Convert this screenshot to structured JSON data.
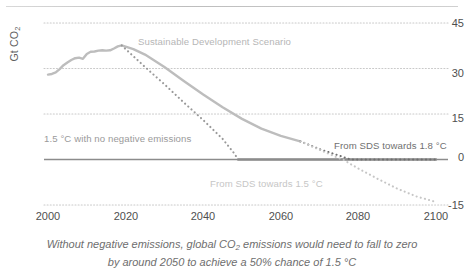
{
  "chart_data": {
    "type": "line",
    "title": "",
    "xlabel": "",
    "ylabel": "Gt CO2",
    "ylabel_display": "Gt CO",
    "ylabel_sub": "2",
    "xlim": [
      2000,
      2100
    ],
    "ylim": [
      -15,
      45
    ],
    "grid": true,
    "grid_style": "dotted-horizontal",
    "legend_position": "inline-annotations",
    "yticks": [
      45,
      30,
      15,
      0,
      -15
    ],
    "xticks": [
      2000,
      2020,
      2040,
      2060,
      2080,
      2100
    ],
    "series": [
      {
        "name": "Historical and Sustainable Development Scenario",
        "label": "Sustainable Development Scenario",
        "style": "solid",
        "color": "#bdbdbd",
        "points": [
          [
            2000,
            28.0
          ],
          [
            2001,
            28.2
          ],
          [
            2002,
            28.7
          ],
          [
            2003,
            29.8
          ],
          [
            2004,
            31.1
          ],
          [
            2005,
            32.0
          ],
          [
            2006,
            32.8
          ],
          [
            2007,
            33.4
          ],
          [
            2008,
            33.6
          ],
          [
            2009,
            33.2
          ],
          [
            2010,
            34.8
          ],
          [
            2011,
            35.5
          ],
          [
            2012,
            35.6
          ],
          [
            2013,
            35.9
          ],
          [
            2014,
            36.0
          ],
          [
            2015,
            35.9
          ],
          [
            2016,
            36.0
          ],
          [
            2017,
            36.6
          ],
          [
            2018,
            37.3
          ],
          [
            2019,
            37.6
          ],
          [
            2020,
            37.2
          ],
          [
            2022,
            36.4
          ],
          [
            2025,
            34.6
          ],
          [
            2030,
            30.5
          ],
          [
            2035,
            25.9
          ],
          [
            2040,
            21.4
          ],
          [
            2045,
            17.2
          ],
          [
            2050,
            13.4
          ],
          [
            2055,
            10.2
          ],
          [
            2060,
            7.8
          ],
          [
            2065,
            6.0
          ]
        ]
      },
      {
        "name": "1.5 C with no negative emissions",
        "label": "1.5 °C with  no negative emissions",
        "style": "dotted",
        "color": "#9a9a9a",
        "points": [
          [
            2019,
            37.6
          ],
          [
            2025,
            30.5
          ],
          [
            2030,
            24.8
          ],
          [
            2035,
            18.8
          ],
          [
            2040,
            13.0
          ],
          [
            2045,
            6.8
          ],
          [
            2048,
            2.0
          ],
          [
            2049,
            0.0
          ]
        ]
      },
      {
        "name": "Zero emissions floor after 2049",
        "label": "",
        "style": "solid",
        "color": "#8c8c8c",
        "points": [
          [
            2049,
            0.0
          ],
          [
            2100,
            0.0
          ]
        ]
      },
      {
        "name": "From SDS towards 1.8 C",
        "label": "From SDS towards 1.8 °C",
        "style": "dotted",
        "color": "#6f6f6f",
        "points": [
          [
            2065,
            6.0
          ],
          [
            2070,
            3.4
          ],
          [
            2075,
            1.3
          ],
          [
            2078,
            0.0
          ],
          [
            2080,
            0.0
          ],
          [
            2100,
            0.0
          ]
        ]
      },
      {
        "name": "From SDS towards 1.5 C",
        "label": "From SDS towards 1.5 °C",
        "style": "dotted",
        "color": "#c6c6c6",
        "points": [
          [
            2065,
            6.0
          ],
          [
            2070,
            3.2
          ],
          [
            2075,
            0.4
          ],
          [
            2076,
            0.0
          ],
          [
            2080,
            -3.0
          ],
          [
            2085,
            -6.4
          ],
          [
            2090,
            -9.6
          ],
          [
            2095,
            -12.2
          ],
          [
            2100,
            -14.0
          ]
        ]
      }
    ],
    "annotations": [
      {
        "text": "Sustainable Development Scenario",
        "x": 2037,
        "y": 39,
        "color": "#b6b6b6"
      },
      {
        "text": "1.5 °C with  no negative emissions",
        "x": 2005,
        "y": 6,
        "color": "#9a9a9a"
      },
      {
        "text": "From SDS towards 1.8 °C",
        "x": 2079,
        "y": 3,
        "color": "#6f6f6f"
      },
      {
        "text": "From SDS towards 1.5 °C",
        "x": 2048,
        "y": -8,
        "color": "#c6c6c6"
      }
    ],
    "caption_line1": "Without negative emissions, global CO2 emissions would need to fall to zero",
    "caption_line2": "by around 2050 to achieve a 50% chance of 1.5 °C"
  },
  "axis": {
    "y_title_main": "Gt CO",
    "y_title_sub": "2",
    "y_ticks": [
      "45",
      "30",
      "15",
      "0",
      "-15"
    ],
    "x_ticks": [
      "2000",
      "2020",
      "2040",
      "2060",
      "2080",
      "2100"
    ]
  },
  "annotations": {
    "sds": "Sustainable Development Scenario",
    "no_negative": "1.5 °C with  no negative emissions",
    "sds_18": "From SDS towards 1.8 °C",
    "sds_15": "From SDS towards 1.5 °C"
  },
  "caption": {
    "line1_pre": "Without negative emissions, global CO",
    "line1_sub": "2",
    "line1_post": " emissions would need to fall to zero",
    "line2": "by around 2050 to achieve a 50% chance of 1.5 °C"
  },
  "colors": {
    "historical": "#bdbdbd",
    "no_negative": "#9a9a9a",
    "sds_18": "#6f6f6f",
    "sds_15": "#c6c6c6",
    "grid": "#c9c9c9",
    "zero_line": "#8c8c8c",
    "text": "#5a5a5a"
  }
}
